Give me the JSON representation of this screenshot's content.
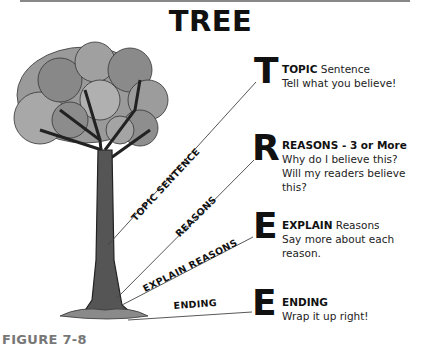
{
  "title": "TREE",
  "steps": [
    {
      "letter": "T",
      "heading_bold": "TOPIC",
      "heading_rest": " Sentence",
      "lines": [
        "Tell what you believe!"
      ],
      "branch_label": "TOPIC SENTENCE"
    },
    {
      "letter": "R",
      "heading_bold": "REASONS - 3 or More",
      "heading_rest": "",
      "lines": [
        "Why do I believe this?",
        "Will my readers believe this?"
      ],
      "branch_label": "REASONS"
    },
    {
      "letter": "E",
      "heading_bold": "EXPLAIN",
      "heading_rest": " Reasons",
      "lines": [
        "Say more about each reason."
      ],
      "branch_label": "EXPLAIN REASONS"
    },
    {
      "letter": "E",
      "heading_bold": "ENDING",
      "heading_rest": "",
      "lines": [
        "Wrap it up right!"
      ],
      "branch_label": "ENDING"
    }
  ],
  "caption": "FIGURE 7-8",
  "colors": {
    "caption": "#777777",
    "foliage_light": "#a8a8a8",
    "foliage_dark": "#7a7a7a",
    "trunk": "#555555"
  }
}
